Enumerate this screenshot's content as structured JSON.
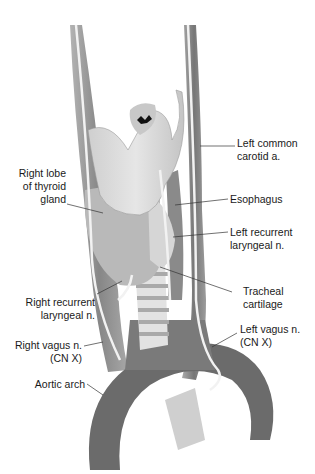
{
  "diagram": {
    "labels": [
      {
        "id": "left-common-carotid",
        "line1": "Left common",
        "line2": "carotid a."
      },
      {
        "id": "right-lobe-thyroid",
        "line1": "Right lobe",
        "line2": "of thyroid",
        "line3": "gland"
      },
      {
        "id": "esophagus",
        "line1": "Esophagus"
      },
      {
        "id": "left-recurrent-laryngeal",
        "line1": "Left recurrent",
        "line2": "laryngeal n."
      },
      {
        "id": "right-recurrent-laryngeal",
        "line1": "Right recurrent",
        "line2": "laryngeal n."
      },
      {
        "id": "tracheal-cartilage",
        "line1": "Tracheal",
        "line2": "cartilage"
      },
      {
        "id": "right-vagus",
        "line1": "Right vagus n.",
        "line2": "(CN X)"
      },
      {
        "id": "left-vagus",
        "line1": "Left vagus n.",
        "line2": "(CN X)"
      },
      {
        "id": "aortic-arch",
        "line1": "Aortic arch"
      }
    ],
    "colors": {
      "vessel": "#6e6e6e",
      "tissue": "#bdbdbd",
      "nerve": "#f2f2f2",
      "text": "#1a1a1a"
    }
  }
}
